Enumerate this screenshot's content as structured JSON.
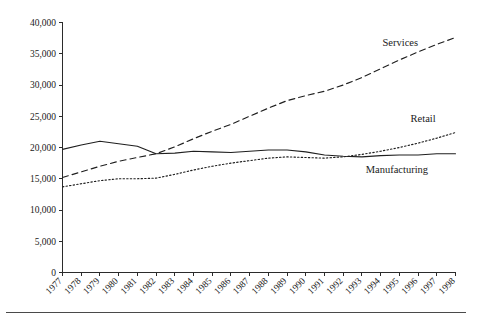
{
  "chart_data": {
    "type": "line",
    "title": "",
    "subtitle": "",
    "xlabel": "",
    "ylabel": "",
    "grid": false,
    "legend_position": "inline-right",
    "xlim": [
      1977,
      1998
    ],
    "ylim": [
      0,
      40000
    ],
    "ytick_step": 5000,
    "ytick_labels": [
      "0",
      "5,000",
      "10,000",
      "15,000",
      "20,000",
      "25,000",
      "30,000",
      "35,000",
      "40,000"
    ],
    "ytick_values": [
      0,
      5000,
      10000,
      15000,
      20000,
      25000,
      30000,
      35000,
      40000
    ],
    "categories": [
      "1977",
      "1978",
      "1979",
      "1980",
      "1981",
      "1982",
      "1983",
      "1984",
      "1985",
      "1986",
      "1987",
      "1988",
      "1989",
      "1990",
      "1991",
      "1992",
      "1993",
      "1994",
      "1995",
      "1996",
      "1997",
      "1998"
    ],
    "x": [
      1977,
      1978,
      1979,
      1980,
      1981,
      1982,
      1983,
      1984,
      1985,
      1986,
      1987,
      1988,
      1989,
      1990,
      1991,
      1992,
      1993,
      1994,
      1995,
      1996,
      1997,
      1998
    ],
    "series": [
      {
        "name": "Manufacturing",
        "style": "solid",
        "label": "Manufacturing",
        "values": [
          19700,
          20400,
          21000,
          20600,
          20200,
          19000,
          19100,
          19400,
          19300,
          19200,
          19400,
          19600,
          19600,
          19300,
          18800,
          18600,
          18500,
          18700,
          18800,
          18800,
          19000,
          19000
        ]
      },
      {
        "name": "Services",
        "style": "dashed",
        "label": "Services",
        "values": [
          15200,
          16100,
          17000,
          17800,
          18400,
          19000,
          20100,
          21400,
          22600,
          23700,
          25000,
          26300,
          27500,
          28300,
          29000,
          30000,
          31200,
          32600,
          34000,
          35300,
          36500,
          37600
        ]
      },
      {
        "name": "Retail",
        "style": "dotted",
        "label": "Retail",
        "values": [
          13700,
          14200,
          14700,
          15000,
          15000,
          15100,
          15700,
          16400,
          17000,
          17500,
          17900,
          18300,
          18500,
          18400,
          18300,
          18500,
          18900,
          19400,
          20000,
          20700,
          21500,
          22400
        ]
      }
    ],
    "annotations": [
      {
        "text": "Services",
        "x": 1994.1,
        "y": 36200
      },
      {
        "text": "Retail",
        "x": 1995.6,
        "y": 24100
      },
      {
        "text": "Manufacturing",
        "x": 1993.2,
        "y": 15900
      }
    ],
    "colors": {
      "line": "#1f1f1f",
      "axis": "#2b2b2b",
      "text": "#1a1a1a",
      "background": "#ffffff"
    }
  }
}
